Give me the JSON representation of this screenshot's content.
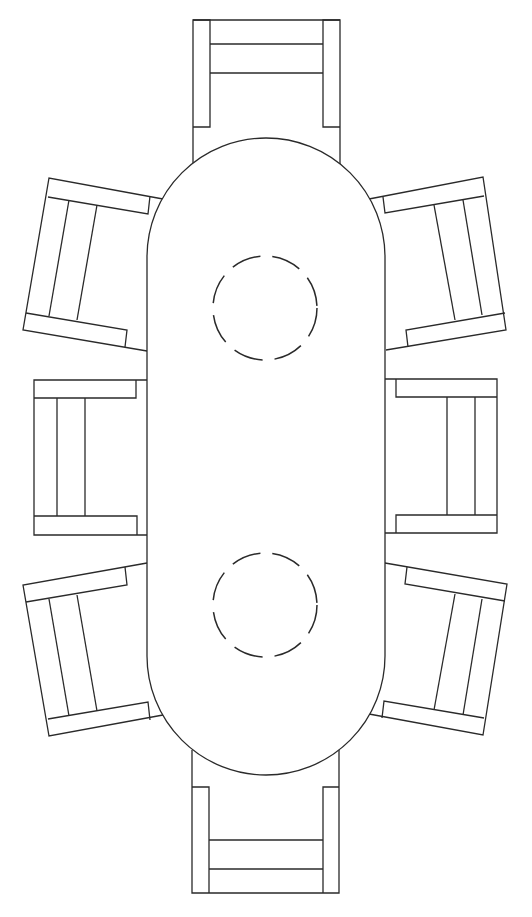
{
  "drawing": {
    "title": "Dining table with eight chairs (plan view)",
    "stroke_color": "#2a2a2a",
    "background": "#ffffff",
    "table": {
      "shape": "stadium",
      "left": 147,
      "right": 385,
      "top": 138,
      "bottom": 775
    },
    "place_settings": [
      {
        "name": "place-setting-top",
        "cx": 265,
        "cy": 308,
        "r": 52
      },
      {
        "name": "place-setting-bottom",
        "cx": 265,
        "cy": 605,
        "r": 52
      }
    ],
    "chairs": [
      {
        "name": "chair-top",
        "outline": "M193,165 L193,20 L340,20 L340,165",
        "details": [
          "M193,20 L210,20 L210,127 L193,127",
          "M340,20 L323,20 L323,127 L340,127",
          "M210,44 L323,44",
          "M210,73 L323,73"
        ]
      },
      {
        "name": "chair-bottom",
        "outline": "M192,750 L192,893 L339,893 L339,750",
        "details": [
          "M192,787 L209,787 L209,893",
          "M339,787 L323,787 L323,893",
          "M209,840 L323,840",
          "M209,869 L323,869"
        ]
      },
      {
        "name": "chair-left-middle",
        "outline": "M147,380 L34,380 L34,535 L147,535",
        "details": [
          "M34,398 L136,398 L136,380",
          "M34,516 L137,516 L137,535",
          "M57,398 L57,516",
          "M85,398 L85,516"
        ]
      },
      {
        "name": "chair-right-middle",
        "outline": "M385,379 L497,379 L497,533 L385,533",
        "details": [
          "M497,397 L396,397 L396,379",
          "M497,515 L396,515 L396,533",
          "M447,397 L447,515",
          "M475,397 L475,515"
        ]
      },
      {
        "name": "chair-left-upper",
        "outline": "M163,199 L49,178 L23,330 L147,351",
        "details": [
          "M48,197 L148,214 L150,196",
          "M26,313 L127,330 L125,347",
          "M69,200 L49,316",
          "M97,205 L77,320"
        ]
      },
      {
        "name": "chair-left-lower",
        "outline": "M147,563 L23,585 L49,736 L163,715",
        "details": [
          "M26,602 L127,585 L125,567",
          "M48,719 L148,702 L150,720",
          "M49,599 L69,716",
          "M77,595 L97,711"
        ]
      },
      {
        "name": "chair-right-upper",
        "outline": "M369,199 L483,177 L506,330 L386,350",
        "details": [
          "M484,196 L385,213 L383,197",
          "M505,313 L406,330 L408,347",
          "M434,205 L455,320",
          "M463,200 L482,315"
        ]
      },
      {
        "name": "chair-right-lower",
        "outline": "M385,563 L507,584 L483,735 L369,714",
        "details": [
          "M505,601 L405,584 L407,567",
          "M484,718 L384,701 L382,718",
          "M455,594 L434,710",
          "M482,599 L463,715"
        ]
      }
    ]
  }
}
